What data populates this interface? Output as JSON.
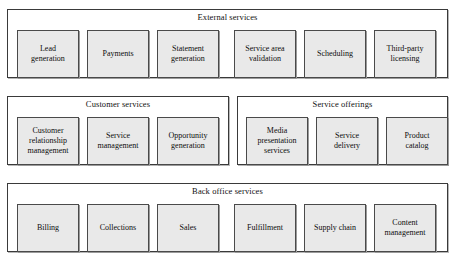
{
  "diagram": {
    "colors": {
      "page_background": "#ffffff",
      "group_background": "#ffffff",
      "group_border": "#3a3a3a",
      "node_fill": "#e9e9e9",
      "node_border": "#4a4a4a",
      "text": "#0d0d0d",
      "shadow": "#b8b8b8"
    },
    "groups": [
      {
        "id": "external-services",
        "title": "External services",
        "geometry": {
          "x": 7,
          "y": 9,
          "width": 441,
          "height": 69
        },
        "nodes": [
          {
            "label": "Lead\ngeneration",
            "geometry": {
              "x": 9,
              "y": 7,
              "width": 62,
              "height": 48
            }
          },
          {
            "label": "Payments",
            "geometry": {
              "x": 79,
              "y": 7,
              "width": 62,
              "height": 48
            }
          },
          {
            "label": "Statement\ngeneration",
            "geometry": {
              "x": 149,
              "y": 7,
              "width": 62,
              "height": 48
            }
          },
          {
            "label": "Service area\nvalidation",
            "geometry": {
              "x": 226,
              "y": 7,
              "width": 62,
              "height": 48
            }
          },
          {
            "label": "Scheduling",
            "geometry": {
              "x": 296,
              "y": 7,
              "width": 62,
              "height": 48
            }
          },
          {
            "label": "Third-party\nlicensing",
            "geometry": {
              "x": 366,
              "y": 7,
              "width": 62,
              "height": 48
            }
          }
        ]
      },
      {
        "id": "customer-services",
        "title": "Customer services",
        "geometry": {
          "x": 7,
          "y": 96,
          "width": 222,
          "height": 69
        },
        "nodes": [
          {
            "label": "Customer\nrelationship\nmanagement",
            "geometry": {
              "x": 9,
              "y": 7,
              "width": 62,
              "height": 48
            }
          },
          {
            "label": "Service\nmanagement",
            "geometry": {
              "x": 79,
              "y": 7,
              "width": 62,
              "height": 48
            }
          },
          {
            "label": "Opportunity\ngeneration",
            "geometry": {
              "x": 149,
              "y": 7,
              "width": 62,
              "height": 48
            }
          }
        ]
      },
      {
        "id": "service-offerings",
        "title": "Service offerings",
        "geometry": {
          "x": 237,
          "y": 96,
          "width": 211,
          "height": 69
        },
        "nodes": [
          {
            "label": "Media\npresentation\nservices",
            "geometry": {
              "x": 8,
              "y": 7,
              "width": 62,
              "height": 48
            }
          },
          {
            "label": "Service\ndelivery",
            "geometry": {
              "x": 78,
              "y": 7,
              "width": 62,
              "height": 48
            }
          },
          {
            "label": "Product\ncatalog",
            "geometry": {
              "x": 148,
              "y": 7,
              "width": 62,
              "height": 48
            }
          }
        ]
      },
      {
        "id": "back-office-services",
        "title": "Back office services",
        "geometry": {
          "x": 7,
          "y": 183,
          "width": 441,
          "height": 69
        },
        "nodes": [
          {
            "label": "Billing",
            "geometry": {
              "x": 9,
              "y": 7,
              "width": 62,
              "height": 48
            }
          },
          {
            "label": "Collections",
            "geometry": {
              "x": 79,
              "y": 7,
              "width": 62,
              "height": 48
            }
          },
          {
            "label": "Sales",
            "geometry": {
              "x": 149,
              "y": 7,
              "width": 62,
              "height": 48
            }
          },
          {
            "label": "Fulfillment",
            "geometry": {
              "x": 226,
              "y": 7,
              "width": 62,
              "height": 48
            }
          },
          {
            "label": "Supply chain",
            "geometry": {
              "x": 296,
              "y": 7,
              "width": 62,
              "height": 48
            }
          },
          {
            "label": "Content\nmanagement",
            "geometry": {
              "x": 366,
              "y": 7,
              "width": 62,
              "height": 48
            }
          }
        ]
      }
    ]
  }
}
